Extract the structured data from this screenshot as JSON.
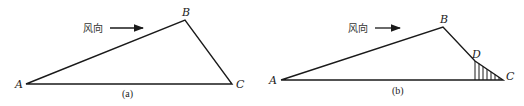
{
  "diagram": {
    "stroke_color": "#1a1a1a",
    "panels": [
      {
        "id": "a",
        "caption": "(a)",
        "wind_label": "风向",
        "vertices": {
          "A": {
            "label": "A",
            "x": 26,
            "y": 84
          },
          "B": {
            "label": "B",
            "x": 185,
            "y": 20
          },
          "C": {
            "label": "C",
            "x": 232,
            "y": 84
          }
        }
      },
      {
        "id": "b",
        "caption": "(b)",
        "wind_label": "风向",
        "vertices": {
          "A": {
            "label": "A",
            "x": 281,
            "y": 80
          },
          "B": {
            "label": "B",
            "x": 443,
            "y": 27
          },
          "D": {
            "label": "D",
            "x": 475,
            "y": 61
          },
          "C": {
            "label": "C",
            "x": 503,
            "y": 80
          }
        },
        "hatched_region": "triangle D-C-foot of D (vertical hatching)"
      }
    ]
  }
}
